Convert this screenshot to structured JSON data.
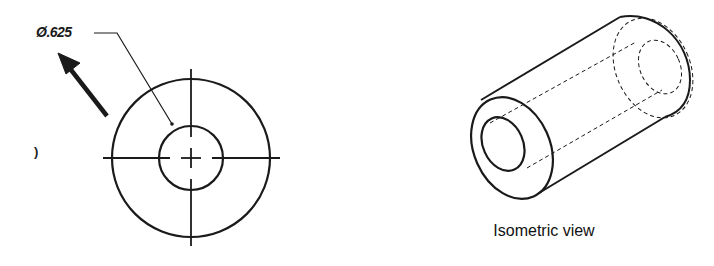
{
  "front_view": {
    "dimension_label": "Ø.625",
    "side_mark": ")",
    "outer_circle": {
      "cx": 191,
      "cy": 158,
      "r": 79
    },
    "inner_circle": {
      "cx": 191,
      "cy": 158,
      "r": 32
    },
    "view_arrow": {
      "from": [
        108,
        117
      ],
      "to": [
        60,
        55
      ]
    }
  },
  "isometric_view": {
    "caption": "Isometric view"
  },
  "colors": {
    "line": "#1a1a1a",
    "background": "#ffffff"
  }
}
